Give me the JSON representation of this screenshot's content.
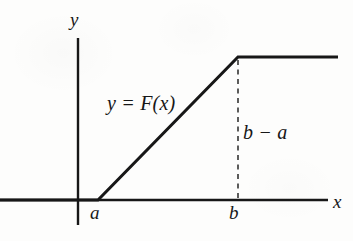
{
  "figure": {
    "background_color": "#fdfdfc",
    "ink_color": "#171717"
  },
  "axes": {
    "x_axis_label": "x",
    "y_axis_label": "y",
    "x_tick_labels": [
      "a",
      "b"
    ],
    "y_tick_labels": [],
    "grid": false
  },
  "annotations": {
    "curve_label": "y = F(x)",
    "height_label": "b − a"
  },
  "chart_data": {
    "type": "line",
    "title": "",
    "subtitle": "",
    "xlabel": "x",
    "ylabel": "y",
    "grid": false,
    "legend_position": "none",
    "xlim": [
      0,
      353
    ],
    "ylim": [
      0,
      241
    ],
    "x_tick_values": [
      "a",
      "b"
    ],
    "series": [
      {
        "name": "y = F(x)",
        "style": "solid",
        "width": 3,
        "color": "#171717",
        "points": [
          {
            "x": 0,
            "y": 200,
            "note": "left end, F = 0 region"
          },
          {
            "x": 98,
            "y": 200,
            "note": "x = a, knee where the ramp begins"
          },
          {
            "x": 238,
            "y": 57,
            "note": "x = b, knee where the ramp saturates"
          },
          {
            "x": 338,
            "y": 57,
            "note": "right end, F constant"
          }
        ]
      },
      {
        "name": "b − a guide",
        "style": "dashed",
        "width": 1.4,
        "color": "#171717",
        "points": [
          {
            "x": 238,
            "y": 60
          },
          {
            "x": 238,
            "y": 200
          }
        ]
      }
    ],
    "axis_lines": [
      {
        "name": "x-axis",
        "from": {
          "x": 0,
          "y": 200
        },
        "to": {
          "x": 328,
          "y": 200
        }
      },
      {
        "name": "y-axis",
        "from": {
          "x": 78,
          "y": 38
        },
        "to": {
          "x": 78,
          "y": 225
        }
      }
    ],
    "label_positions": {
      "y": {
        "x": 76,
        "y": 20
      },
      "x": {
        "x": 339,
        "y": 201
      },
      "a": {
        "x": 96,
        "y": 214
      },
      "b": {
        "x": 235,
        "y": 214
      },
      "curve_label": {
        "x": 143,
        "y": 105
      },
      "height_label": {
        "x": 264,
        "y": 133
      }
    }
  }
}
